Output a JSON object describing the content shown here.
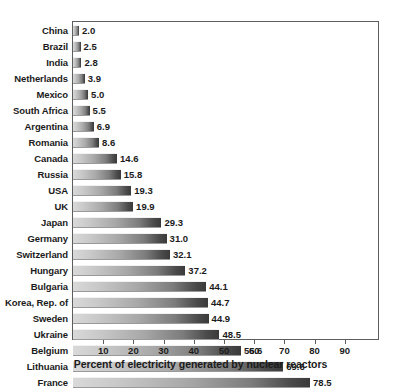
{
  "chart_data": {
    "type": "bar",
    "orientation": "horizontal",
    "title": "",
    "xlabel": "Percent of electricity generated by nuclear reactors",
    "ylabel": "",
    "xlim": [
      0,
      95
    ],
    "xticks": [
      10,
      20,
      30,
      40,
      50,
      60,
      70,
      80,
      90
    ],
    "xtick_labels": [
      "10",
      "20",
      "30",
      "40",
      "50",
      "60",
      "70",
      "80",
      "90"
    ],
    "grid": false,
    "legend": false,
    "categories": [
      "China",
      "Brazil",
      "India",
      "Netherlands",
      "Mexico",
      "South Africa",
      "Argentina",
      "Romania",
      "Canada",
      "Russia",
      "USA",
      "UK",
      "Japan",
      "Germany",
      "Switzerland",
      "Hungary",
      "Bulgaria",
      "Korea, Rep. of",
      "Sweden",
      "Ukraine",
      "Belgium",
      "Lithuania",
      "France"
    ],
    "values": [
      2.0,
      2.5,
      2.8,
      3.9,
      5.0,
      5.5,
      6.9,
      8.6,
      14.6,
      15.8,
      19.3,
      19.9,
      29.3,
      31.0,
      32.1,
      37.2,
      44.1,
      44.7,
      44.9,
      48.5,
      55.6,
      69.6,
      78.5
    ],
    "value_labels": [
      "2.0",
      "2.5",
      "2.8",
      "3.9",
      "5.0",
      "5.5",
      "6.9",
      "8.6",
      "14.6",
      "15.8",
      "19.3",
      "19.9",
      "29.3",
      "31.0",
      "32.1",
      "37.2",
      "44.1",
      "44.7",
      "44.9",
      "48.5",
      "55.6",
      "69.6",
      "78.5"
    ],
    "bar_color_start": "#d9d9d9",
    "bar_color_end": "#3a3a3a",
    "frame_color": "#5d5d5d",
    "text_color": "#1b1b1b",
    "background": "#ffffff"
  }
}
